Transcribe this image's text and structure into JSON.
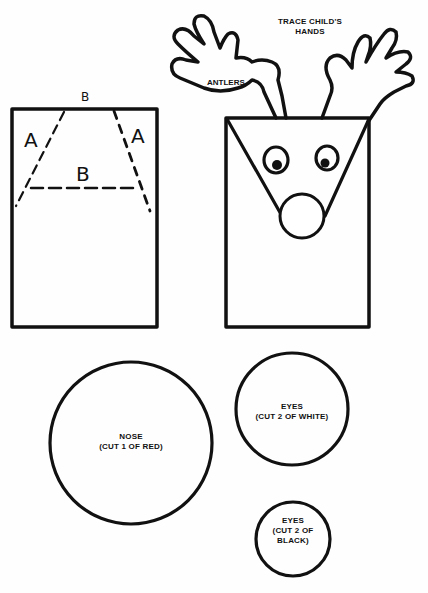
{
  "pattern": {
    "title": "Reindeer Paper Bag Puppet Pattern",
    "bag_diagram": {
      "top_label": "B",
      "left_label": "A",
      "right_label": "A",
      "middle_label": "B"
    },
    "puppet": {
      "instruction_line1": "TRACE CHILD'S",
      "instruction_line2": "HANDS",
      "antlers_label": "ANTLERS"
    },
    "pieces": [
      {
        "name": "NOSE",
        "instruction": "(CUT 1 OF RED)"
      },
      {
        "name": "EYES",
        "instruction_line1": "(CUT 2 OF WHITE)"
      },
      {
        "name": "EYES",
        "instruction_line1": "(CUT 2 OF",
        "instruction_line2": "BLACK)"
      }
    ],
    "colors": {
      "ink": "#111111",
      "paper": "#fefefe"
    }
  }
}
